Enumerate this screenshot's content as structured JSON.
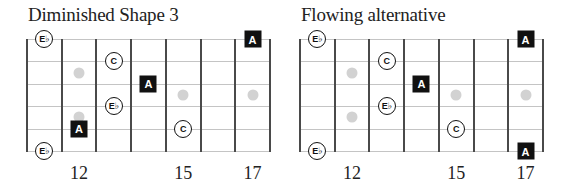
{
  "layout": {
    "string_y": [
      0,
      22.4,
      44.8,
      67.2,
      89.6,
      112
    ],
    "fret_spacing": 34.7,
    "first_fret_number": 11,
    "colors": {
      "note_fill": "#111111",
      "inlay": "#d2d2d2",
      "fret_line": "#4a4a4a",
      "string_line": "#c4c4c4"
    }
  },
  "diagrams": [
    {
      "title": "Diminished Shape 3",
      "left": 27,
      "fret_labels": [
        {
          "fret": 12,
          "label": "12"
        },
        {
          "fret": 15,
          "label": "15"
        },
        {
          "fret": 17,
          "label": "17"
        }
      ],
      "inlays": [
        {
          "fret": 12,
          "between": [
            2,
            3
          ]
        },
        {
          "fret": 12,
          "between": [
            4,
            5
          ]
        },
        {
          "fret": 15,
          "between": [
            3,
            4
          ]
        },
        {
          "fret": 17,
          "between": [
            3,
            4
          ]
        }
      ],
      "notes": [
        {
          "string": 1,
          "fret": 11,
          "label": "E♭",
          "shape": "circle",
          "icon": "note-circle-icon"
        },
        {
          "string": 1,
          "fret": 17,
          "label": "A",
          "shape": "square",
          "icon": "note-square-icon"
        },
        {
          "string": 2,
          "fret": 13,
          "label": "C",
          "shape": "circle",
          "icon": "note-circle-icon"
        },
        {
          "string": 3,
          "fret": 14,
          "label": "A",
          "shape": "square",
          "icon": "note-square-icon"
        },
        {
          "string": 4,
          "fret": 13,
          "label": "E♭",
          "shape": "circle",
          "icon": "note-circle-icon"
        },
        {
          "string": 5,
          "fret": 12,
          "label": "A",
          "shape": "square",
          "icon": "note-square-icon"
        },
        {
          "string": 5,
          "fret": 15,
          "label": "C",
          "shape": "circle",
          "icon": "note-circle-icon"
        },
        {
          "string": 6,
          "fret": 11,
          "label": "E♭",
          "shape": "circle",
          "icon": "note-circle-icon"
        }
      ]
    },
    {
      "title": "Flowing alternative",
      "left": 300,
      "fret_labels": [
        {
          "fret": 12,
          "label": "12"
        },
        {
          "fret": 15,
          "label": "15"
        },
        {
          "fret": 17,
          "label": "17"
        }
      ],
      "inlays": [
        {
          "fret": 12,
          "between": [
            2,
            3
          ]
        },
        {
          "fret": 12,
          "between": [
            4,
            5
          ]
        },
        {
          "fret": 15,
          "between": [
            3,
            4
          ]
        },
        {
          "fret": 17,
          "between": [
            3,
            4
          ]
        }
      ],
      "notes": [
        {
          "string": 1,
          "fret": 11,
          "label": "E♭",
          "shape": "circle",
          "icon": "note-circle-icon"
        },
        {
          "string": 1,
          "fret": 17,
          "label": "A",
          "shape": "square",
          "icon": "note-square-icon"
        },
        {
          "string": 2,
          "fret": 13,
          "label": "C",
          "shape": "circle",
          "icon": "note-circle-icon"
        },
        {
          "string": 3,
          "fret": 14,
          "label": "A",
          "shape": "square",
          "icon": "note-square-icon"
        },
        {
          "string": 4,
          "fret": 13,
          "label": "E♭",
          "shape": "circle",
          "icon": "note-circle-icon"
        },
        {
          "string": 5,
          "fret": 15,
          "label": "C",
          "shape": "circle",
          "icon": "note-circle-icon"
        },
        {
          "string": 6,
          "fret": 11,
          "label": "E♭",
          "shape": "circle",
          "icon": "note-circle-icon"
        },
        {
          "string": 6,
          "fret": 17,
          "label": "A",
          "shape": "square",
          "icon": "note-square-icon"
        }
      ]
    }
  ]
}
